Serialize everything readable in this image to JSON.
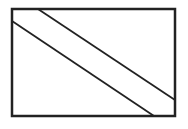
{
  "diagram": {
    "colors": {
      "stroke": "#222222",
      "background": "#ffffff"
    },
    "rectangle": {
      "x": 12,
      "y": 9,
      "width": 163,
      "height": 107,
      "stroke_width": 2.5
    },
    "lines": [
      {
        "name": "upper-diagonal",
        "x1": 38,
        "y1": 9,
        "x2": 175,
        "y2": 100,
        "stroke_width": 1.8
      },
      {
        "name": "lower-diagonal",
        "x1": 12,
        "y1": 21,
        "x2": 154,
        "y2": 116,
        "stroke_width": 1.8
      }
    ]
  }
}
